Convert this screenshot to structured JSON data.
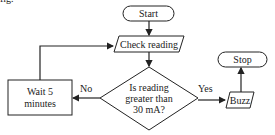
{
  "caption_fragment": "fig.",
  "flowchart": {
    "nodes": {
      "start": {
        "label": "Start",
        "shape": "terminal"
      },
      "check": {
        "label": "Check reading",
        "shape": "parallelogram"
      },
      "decision": {
        "line1": "Is reading",
        "line2": "greater than",
        "line3": "30 mA?",
        "shape": "diamond"
      },
      "wait": {
        "line1": "Wait 5",
        "line2": "minutes",
        "shape": "rectangle"
      },
      "buzz": {
        "label": "Buzz",
        "shape": "parallelogram"
      },
      "stop": {
        "label": "Stop",
        "shape": "terminal"
      }
    },
    "edges": {
      "no_label": "No",
      "yes_label": "Yes"
    },
    "colors": {
      "stroke": "#222222",
      "background": "#ffffff"
    }
  }
}
